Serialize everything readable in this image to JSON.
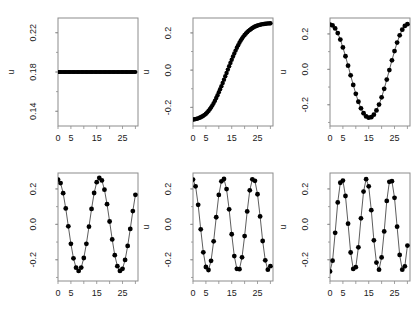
{
  "figure": {
    "layout": "grid",
    "rows": 2,
    "cols": 3,
    "background_color": "#ffffff",
    "marker_color": "#000000",
    "line_color": "#333333",
    "frame_color": "#8c8c8c"
  },
  "chart_data": [
    {
      "id": "panel-1",
      "type": "scatter",
      "title": "",
      "xlabel": "",
      "ylabel": "u",
      "xlim": [
        0,
        31
      ],
      "ylim": [
        0.125,
        0.235
      ],
      "xticks": [
        0,
        5,
        15,
        25
      ],
      "xtick_labels": [
        "0",
        "5",
        "15",
        "25"
      ],
      "xminor": [
        10,
        20,
        30
      ],
      "yticks": [
        0.14,
        0.18,
        0.22
      ],
      "ytick_labels": [
        "0.14",
        "0.18",
        "0.22"
      ],
      "grid": false,
      "connect": false,
      "marker_size": 2.0,
      "x": [
        0,
        0.5,
        1,
        1.5,
        2,
        2.5,
        3,
        3.5,
        4,
        4.5,
        5,
        5.5,
        6,
        6.5,
        7,
        7.5,
        8,
        8.5,
        9,
        9.5,
        10,
        10.5,
        11,
        11.5,
        12,
        12.5,
        13,
        13.5,
        14,
        14.5,
        15,
        15.5,
        16,
        16.5,
        17,
        17.5,
        18,
        18.5,
        19,
        19.5,
        20,
        20.5,
        21,
        21.5,
        22,
        22.5,
        23,
        23.5,
        24,
        24.5,
        25,
        25.5,
        26,
        26.5,
        27,
        27.5,
        28,
        28.5,
        29,
        29.5,
        30
      ],
      "y": [
        0.18,
        0.18,
        0.18,
        0.18,
        0.18,
        0.18,
        0.18,
        0.18,
        0.18,
        0.18,
        0.18,
        0.18,
        0.18,
        0.18,
        0.18,
        0.18,
        0.18,
        0.18,
        0.18,
        0.18,
        0.18,
        0.18,
        0.18,
        0.18,
        0.18,
        0.18,
        0.18,
        0.18,
        0.18,
        0.18,
        0.18,
        0.18,
        0.18,
        0.18,
        0.18,
        0.18,
        0.18,
        0.18,
        0.18,
        0.18,
        0.18,
        0.18,
        0.18,
        0.18,
        0.18,
        0.18,
        0.18,
        0.18,
        0.18,
        0.18,
        0.18,
        0.18,
        0.18,
        0.18,
        0.18,
        0.18,
        0.18,
        0.18,
        0.18,
        0.18,
        0.18
      ]
    },
    {
      "id": "panel-2",
      "type": "scatter",
      "title": "",
      "xlabel": "",
      "ylabel": "u",
      "xlim": [
        0,
        31
      ],
      "ylim": [
        -0.3,
        0.28
      ],
      "xticks": [
        0,
        5,
        15,
        25
      ],
      "xtick_labels": [
        "0",
        "5",
        "15",
        "25"
      ],
      "xminor": [
        10,
        20,
        30
      ],
      "yticks": [
        -0.2,
        0.0,
        0.2
      ],
      "ytick_labels": [
        "-0.2",
        "0.0",
        "0.2"
      ],
      "grid": false,
      "connect": false,
      "marker_size": 2.2,
      "x": [
        0,
        0.5,
        1,
        1.5,
        2,
        2.5,
        3,
        3.5,
        4,
        4.5,
        5,
        5.5,
        6,
        6.5,
        7,
        7.5,
        8,
        8.5,
        9,
        9.5,
        10,
        10.5,
        11,
        11.5,
        12,
        12.5,
        13,
        13.5,
        14,
        14.5,
        15,
        15.5,
        16,
        16.5,
        17,
        17.5,
        18,
        18.5,
        19,
        19.5,
        20,
        20.5,
        21,
        21.5,
        22,
        22.5,
        23,
        23.5,
        24,
        24.5,
        25,
        25.5,
        26,
        26.5,
        27,
        27.5,
        28,
        28.5,
        29,
        29.5,
        30
      ],
      "y": [
        -0.265,
        -0.264,
        -0.263,
        -0.261,
        -0.259,
        -0.256,
        -0.253,
        -0.249,
        -0.245,
        -0.24,
        -0.234,
        -0.227,
        -0.219,
        -0.21,
        -0.2,
        -0.189,
        -0.177,
        -0.164,
        -0.15,
        -0.135,
        -0.119,
        -0.103,
        -0.086,
        -0.069,
        -0.051,
        -0.033,
        -0.015,
        0.003,
        0.021,
        0.039,
        0.056,
        0.073,
        0.089,
        0.105,
        0.12,
        0.134,
        0.147,
        0.159,
        0.17,
        0.18,
        0.189,
        0.197,
        0.204,
        0.211,
        0.216,
        0.221,
        0.226,
        0.23,
        0.234,
        0.237,
        0.24,
        0.242,
        0.244,
        0.246,
        0.247,
        0.248,
        0.249,
        0.25,
        0.251,
        0.251,
        0.252
      ]
    },
    {
      "id": "panel-3",
      "type": "line",
      "title": "",
      "xlabel": "",
      "ylabel": "u",
      "xlim": [
        0,
        31
      ],
      "ylim": [
        -0.32,
        0.29
      ],
      "xticks": [
        0,
        5,
        15,
        25
      ],
      "xtick_labels": [
        "0",
        "5",
        "15",
        "25"
      ],
      "xminor": [
        10,
        20,
        30
      ],
      "yticks": [
        -0.2,
        0.0,
        0.2
      ],
      "ytick_labels": [
        "-0.2",
        "0.0",
        "0.2"
      ],
      "grid": false,
      "connect": true,
      "marker_size": 2.4,
      "x": [
        0,
        1,
        2,
        3,
        4,
        5,
        6,
        7,
        8,
        9,
        10,
        11,
        12,
        13,
        14,
        15,
        16,
        17,
        18,
        19,
        20,
        21,
        22,
        23,
        24,
        25,
        26,
        27,
        28,
        29,
        30
      ],
      "y": [
        0.253,
        0.248,
        0.231,
        0.205,
        0.168,
        0.124,
        0.074,
        0.021,
        -0.034,
        -0.088,
        -0.138,
        -0.183,
        -0.22,
        -0.248,
        -0.266,
        -0.273,
        -0.27,
        -0.256,
        -0.232,
        -0.199,
        -0.158,
        -0.11,
        -0.058,
        -0.004,
        0.051,
        0.103,
        0.151,
        0.192,
        0.224,
        0.245,
        0.255
      ]
    },
    {
      "id": "panel-4",
      "type": "line",
      "title": "",
      "xlabel": "",
      "ylabel": "",
      "xlim": [
        0,
        31
      ],
      "ylim": [
        -0.32,
        0.29
      ],
      "xticks": [
        0,
        5,
        15,
        25
      ],
      "xtick_labels": [
        "0",
        "5",
        "15",
        "25"
      ],
      "xminor": [
        10,
        20,
        30
      ],
      "yticks": [
        -0.2,
        0.0,
        0.2
      ],
      "ytick_labels": [
        "-0.2",
        "0.0",
        "0.2"
      ],
      "grid": false,
      "connect": true,
      "marker_size": 2.4,
      "x": [
        0,
        1,
        2,
        3,
        4,
        5,
        6,
        7,
        8,
        9,
        10,
        11,
        12,
        13,
        14,
        15,
        16,
        17,
        18,
        19,
        20,
        21,
        22,
        23,
        24,
        25,
        26,
        27,
        28,
        29,
        30
      ],
      "y": [
        0.253,
        0.233,
        0.176,
        0.09,
        -0.011,
        -0.11,
        -0.192,
        -0.245,
        -0.263,
        -0.244,
        -0.19,
        -0.11,
        -0.013,
        0.087,
        0.177,
        0.238,
        0.262,
        0.248,
        0.196,
        0.114,
        0.016,
        -0.085,
        -0.174,
        -0.236,
        -0.263,
        -0.251,
        -0.201,
        -0.122,
        -0.026,
        0.075,
        0.167
      ]
    },
    {
      "id": "panel-5",
      "type": "line",
      "title": "",
      "xlabel": "",
      "ylabel": "u",
      "xlim": [
        0,
        31
      ],
      "ylim": [
        -0.32,
        0.29
      ],
      "xticks": [
        0,
        5,
        15,
        25
      ],
      "xtick_labels": [
        "0",
        "5",
        "15",
        "25"
      ],
      "xminor": [
        10,
        20,
        30
      ],
      "yticks": [
        -0.2,
        0.0,
        0.2
      ],
      "ytick_labels": [
        "-0.2",
        "0.0",
        "0.2"
      ],
      "grid": false,
      "connect": true,
      "marker_size": 2.4,
      "x": [
        0,
        1,
        2,
        3,
        4,
        5,
        6,
        7,
        8,
        9,
        10,
        11,
        12,
        13,
        14,
        15,
        16,
        17,
        18,
        19,
        20,
        21,
        22,
        23,
        24,
        25,
        26,
        27,
        28,
        29,
        30
      ],
      "y": [
        0.253,
        0.215,
        0.11,
        -0.028,
        -0.158,
        -0.241,
        -0.258,
        -0.206,
        -0.096,
        0.04,
        0.166,
        0.243,
        0.256,
        0.199,
        0.085,
        -0.056,
        -0.179,
        -0.251,
        -0.253,
        -0.186,
        -0.066,
        0.073,
        0.192,
        0.254,
        0.246,
        0.17,
        0.045,
        -0.094,
        -0.203,
        -0.256,
        -0.236
      ]
    },
    {
      "id": "panel-6",
      "type": "line",
      "title": "",
      "xlabel": "",
      "ylabel": "u",
      "xlim": [
        0,
        31
      ],
      "ylim": [
        -0.32,
        0.29
      ],
      "xticks": [
        0,
        5,
        15,
        25
      ],
      "xtick_labels": [
        "0",
        "5",
        "15",
        "25"
      ],
      "xminor": [
        10,
        20,
        30
      ],
      "yticks": [
        -0.2,
        0.0,
        0.2
      ],
      "ytick_labels": [
        "-0.2",
        "0.0",
        "0.2"
      ],
      "grid": false,
      "connect": true,
      "marker_size": 2.4,
      "x": [
        0,
        1,
        2,
        3,
        4,
        5,
        6,
        7,
        8,
        9,
        10,
        11,
        12,
        13,
        14,
        15,
        16,
        17,
        18,
        19,
        20,
        21,
        22,
        23,
        24,
        25,
        26,
        27,
        28,
        29,
        30
      ],
      "y": [
        -0.266,
        -0.205,
        -0.048,
        0.124,
        0.235,
        0.247,
        0.16,
        0.004,
        -0.159,
        -0.252,
        -0.242,
        -0.13,
        0.034,
        0.185,
        0.255,
        0.215,
        0.08,
        -0.09,
        -0.216,
        -0.256,
        -0.187,
        -0.04,
        0.132,
        0.24,
        0.244,
        0.15,
        -0.013,
        -0.173,
        -0.256,
        -0.237,
        -0.12
      ]
    }
  ]
}
